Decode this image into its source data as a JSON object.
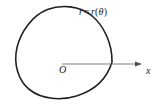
{
  "figure": {
    "background_color": "#ffffff",
    "width": 161,
    "height": 104
  },
  "curve": {
    "name": "polar-curve",
    "label": "r = r(θ)",
    "label_parts": {
      "radius_symbol": "r",
      "equals": "=",
      "function_name": "r",
      "open_paren": "(",
      "variable": "θ",
      "close_paren": ")"
    },
    "stroke_color": "#231f20",
    "stroke_width": 1.6,
    "fill": "none",
    "closed": true,
    "path": "M 112,62 C 112,44 104,26 92,16 C 80,6 62,5 48,10 C 33,16 21,32 17,48 C 13,64 18,81 30,90 C 42,99 60,101 76,96 C 92,91 106,80 112,62 Z"
  },
  "axis": {
    "name": "x-axis",
    "label": "x",
    "stroke_color": "#808080",
    "stroke_width": 1.2,
    "start_x": 62,
    "end_x": 143,
    "y": 64,
    "arrowhead": "right-triangle",
    "arrowhead_color": "#4d4d4d"
  },
  "origin": {
    "name": "origin",
    "label": "O",
    "x": 62,
    "y": 64
  }
}
